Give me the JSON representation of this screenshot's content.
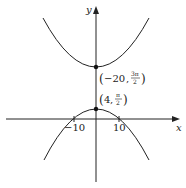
{
  "axes": {
    "x_label": "x",
    "y_label": "y",
    "ticks": [
      {
        "label": "−10",
        "value": -10
      },
      {
        "label": "10",
        "value": 10
      }
    ]
  },
  "curves": [
    {
      "name": "upper-parabola",
      "opens": "up",
      "vertex_label_x": "−20",
      "vertex_label_y_num": "3π",
      "vertex_label_y_den": "2"
    },
    {
      "name": "lower-parabola",
      "opens": "down",
      "vertex_label_x": "4",
      "vertex_label_y_num": "π",
      "vertex_label_y_den": "2"
    }
  ],
  "points": [
    {
      "label": "(−20, 3π/2)"
    },
    {
      "label": "(4, π/2)"
    }
  ],
  "colors": {
    "stroke": "#222222",
    "background": "#ffffff"
  }
}
